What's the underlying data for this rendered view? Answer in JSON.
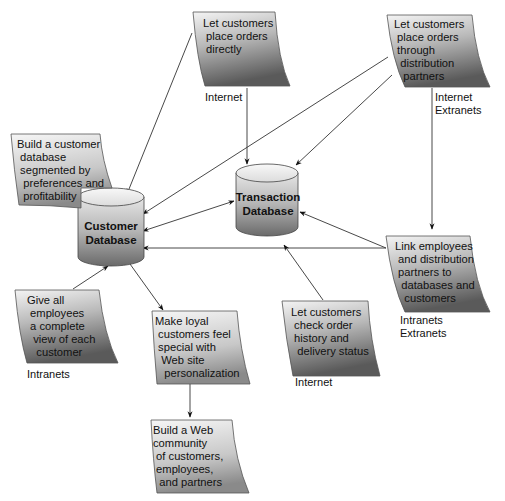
{
  "diagram": {
    "databases": {
      "customer": {
        "line1": "Customer",
        "line2": "Database"
      },
      "transaction": {
        "line1": "Transaction",
        "line2": "Database"
      }
    },
    "notes": [
      {
        "id": "place-orders-directly",
        "lines": [
          "Let customers",
          " place orders",
          " directly"
        ],
        "network": [
          "Internet"
        ]
      },
      {
        "id": "place-orders-partners",
        "lines": [
          "Let customers",
          " place orders",
          " through",
          "  distribution",
          "   partners"
        ],
        "network": [
          "Internet",
          "Extranets"
        ]
      },
      {
        "id": "build-customer-db",
        "lines": [
          "Build a customer",
          " database",
          " segmented by",
          "  preferences and",
          "  profitability"
        ],
        "network": []
      },
      {
        "id": "link-employees",
        "lines": [
          "Link employees",
          " and distribution",
          " partners to",
          "  databases and",
          "   customers"
        ],
        "network": [
          "Intranets",
          "Extranets"
        ]
      },
      {
        "id": "give-employees-view",
        "lines": [
          "Give all",
          " employees",
          " a complete",
          "  view of each",
          "   customer"
        ],
        "network": [
          "Intranets"
        ]
      },
      {
        "id": "make-customers-special",
        "lines": [
          "Make loyal",
          " customers feel",
          " special with",
          "  Web site",
          "   personalization"
        ],
        "network": []
      },
      {
        "id": "check-order-history",
        "lines": [
          "Let customers",
          " check order",
          " history and",
          "  delivery status"
        ],
        "network": [
          "Internet"
        ]
      },
      {
        "id": "build-web-community",
        "lines": [
          "Build a Web",
          "community",
          " of customers,",
          " employees,",
          "  and partners"
        ],
        "network": []
      }
    ],
    "connections": [
      {
        "from": "place-orders-directly",
        "to": "Customer Database",
        "direction": "forward"
      },
      {
        "from": "place-orders-directly",
        "to": "Transaction Database",
        "direction": "forward"
      },
      {
        "from": "place-orders-partners",
        "to": "Customer Database",
        "direction": "forward"
      },
      {
        "from": "place-orders-partners",
        "to": "Transaction Database",
        "direction": "forward"
      },
      {
        "from": "place-orders-partners",
        "to": "link-employees",
        "direction": "forward"
      },
      {
        "from": "Customer Database",
        "to": "Transaction Database",
        "direction": "bidirectional"
      },
      {
        "from": "link-employees",
        "to": "Customer Database",
        "direction": "forward"
      },
      {
        "from": "link-employees",
        "to": "Transaction Database",
        "direction": "forward"
      },
      {
        "from": "check-order-history",
        "to": "Transaction Database",
        "direction": "forward"
      },
      {
        "from": "give-employees-view",
        "to": "Customer Database",
        "direction": "forward"
      },
      {
        "from": "Customer Database",
        "to": "make-customers-special",
        "direction": "forward"
      },
      {
        "from": "make-customers-special",
        "to": "build-web-community",
        "direction": "forward"
      }
    ]
  }
}
